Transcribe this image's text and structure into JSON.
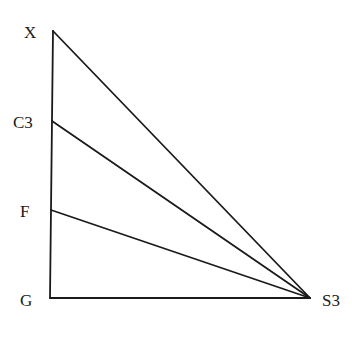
{
  "diagram": {
    "points": {
      "X": {
        "label": "X",
        "x": 53,
        "y": 31
      },
      "C3": {
        "label": "C3",
        "x": 52,
        "y": 121
      },
      "F": {
        "label": "F",
        "x": 51,
        "y": 210
      },
      "G": {
        "label": "G",
        "x": 50,
        "y": 298
      },
      "S3": {
        "label": "S3",
        "x": 310,
        "y": 298
      }
    },
    "edges": [
      [
        "X",
        "G"
      ],
      [
        "G",
        "S3"
      ],
      [
        "X",
        "S3"
      ],
      [
        "C3",
        "S3"
      ],
      [
        "F",
        "S3"
      ]
    ],
    "colors": {
      "line": "#1a1a1a",
      "background": "#ffffff"
    }
  }
}
